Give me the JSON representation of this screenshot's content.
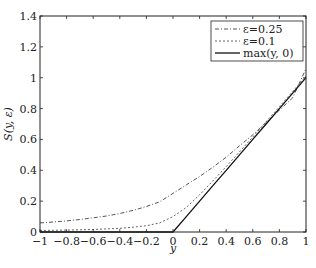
{
  "chart_data": {
    "type": "line",
    "title": "",
    "xlabel": "y",
    "ylabel": "S(y, ε)",
    "xlim": [
      -1,
      1
    ],
    "ylim": [
      0,
      1.4
    ],
    "xticks": [
      -1,
      -0.8,
      -0.6,
      -0.4,
      -0.2,
      0,
      0.2,
      0.4,
      0.6,
      0.8,
      1
    ],
    "xtick_labels": [
      "−1",
      "−0.8",
      "−0.6",
      "−0.4",
      "−0.2",
      "0",
      "0.2",
      "0.4",
      "0.6",
      "0.8",
      "1"
    ],
    "yticks": [
      0,
      0.2,
      0.4,
      0.6,
      0.8,
      1,
      1.2,
      1.4
    ],
    "ytick_labels": [
      "0",
      "0.2",
      "0.4",
      "0.6",
      "0.8",
      "1",
      "1.2",
      "1.4"
    ],
    "grid": false,
    "legend_position": "upper right",
    "x": [
      -1,
      -0.9,
      -0.8,
      -0.7,
      -0.6,
      -0.5,
      -0.4,
      -0.3,
      -0.2,
      -0.1,
      0,
      0.1,
      0.2,
      0.3,
      0.4,
      0.5,
      0.6,
      0.7,
      0.8,
      0.9,
      1
    ],
    "series": [
      {
        "name": "ε=0.25",
        "style": "dashdot",
        "color": "#555555",
        "values": [
          0.059,
          0.065,
          0.072,
          0.081,
          0.092,
          0.104,
          0.12,
          0.14,
          0.165,
          0.196,
          0.25,
          0.305,
          0.36,
          0.42,
          0.485,
          0.559,
          0.63,
          0.71,
          0.79,
          0.87,
          1.059
        ]
      },
      {
        "name": "ε=0.1",
        "style": "dashed",
        "color": "#666666",
        "values": [
          0.01,
          0.011,
          0.012,
          0.014,
          0.016,
          0.02,
          0.024,
          0.031,
          0.041,
          0.059,
          0.1,
          0.159,
          0.241,
          0.331,
          0.424,
          0.52,
          0.616,
          0.714,
          0.812,
          0.911,
          1.01
        ]
      },
      {
        "name": "max(y, 0)",
        "style": "solid",
        "color": "#111111",
        "values": [
          0,
          0,
          0,
          0,
          0,
          0,
          0,
          0,
          0,
          0,
          0,
          0.1,
          0.2,
          0.3,
          0.4,
          0.5,
          0.6,
          0.7,
          0.8,
          0.9,
          1.0
        ]
      }
    ]
  }
}
